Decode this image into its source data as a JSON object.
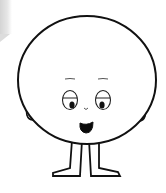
{
  "illustration": {
    "subject": "cartoon round-headed character",
    "colors": {
      "outline": "#111111",
      "fill": "#ffffff",
      "background": "#ffffff",
      "corner_shade": "#d9d9d9"
    }
  }
}
